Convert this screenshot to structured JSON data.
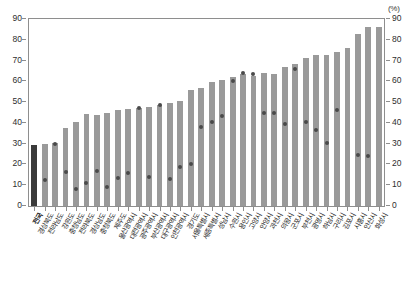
{
  "chart_data": {
    "type": "bar",
    "title": "",
    "subtitle": "",
    "xlabel": "",
    "ylabel": "",
    "unit_label_left": "",
    "unit_label_right": "(%)",
    "ylim": [
      0,
      90
    ],
    "yticks": [
      0,
      10,
      20,
      30,
      40,
      50,
      60,
      70,
      80,
      90
    ],
    "ytick_labels": [
      "0",
      "10",
      "20",
      "30",
      "40",
      "50",
      "60",
      "70",
      "80",
      "90"
    ],
    "right_axis": true,
    "right_ytick_labels": [
      "0",
      "10",
      "20",
      "30",
      "40",
      "50",
      "60",
      "70",
      "80",
      "90"
    ],
    "grid": false,
    "legend": "none",
    "highlight_index": 0,
    "categories": [
      "전국",
      "경상북도",
      "전라남도",
      "강원도",
      "충청남도",
      "전라북도",
      "경상남도",
      "충청북도",
      "제주도",
      "울산광역시",
      "대전광역시",
      "광주광역시",
      "부산광역시",
      "대구광역시",
      "인천광역시",
      "경기도",
      "서울특별시",
      "세종특별시",
      "성남시",
      "수원시",
      "용인시",
      "고양시",
      "안양시",
      "과천시",
      "의왕시",
      "군포시",
      "부천시",
      "광명시",
      "하남시",
      "구리시",
      "김포시",
      "시흥시",
      "안산시",
      "화성시"
    ],
    "series": [
      {
        "name": "bar-series",
        "style": "bar",
        "values": [
          29.5,
          30.0,
          30.2,
          37.5,
          40.2,
          44.2,
          44.0,
          44.8,
          46.4,
          46.6,
          47.0,
          47.5,
          48.8,
          49.6,
          50.5,
          55.8,
          57.0,
          59.8,
          60.6,
          62.0,
          63.4,
          62.4,
          64.0,
          63.6,
          66.8,
          68.2,
          71.4,
          72.8,
          72.6,
          74.2,
          76.0,
          83.0,
          86.0,
          86.0
        ]
      },
      {
        "name": "dot-series",
        "style": "scatter",
        "values": [
          null,
          12.6,
          30.0,
          16.3,
          8.3,
          11.0,
          16.8,
          9.2,
          13.4,
          16.0,
          47.0,
          13.8,
          48.8,
          13.2,
          19.0,
          20.3,
          38.0,
          40.6,
          43.5,
          60.2,
          64.0,
          63.6,
          45.0,
          44.8,
          39.3,
          66.0,
          40.2,
          36.4,
          30.2,
          46.0,
          null,
          24.5,
          24.0,
          null
        ]
      }
    ],
    "colors": {
      "bar": "#9a9a9a",
      "bar_highlight": "#3b3b3b",
      "dot": "#4a4a4a",
      "axis": "#8e8e8e",
      "text": "#262626"
    }
  }
}
